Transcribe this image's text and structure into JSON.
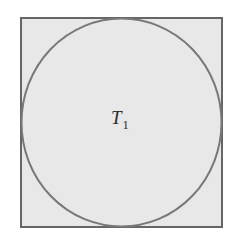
{
  "figure": {
    "background_color": "#ffffff",
    "width": 239,
    "height": 242,
    "square": {
      "name": "bounding-square",
      "x": 21,
      "y": 18,
      "width": 201,
      "height": 209,
      "fill_color": "#e8e8e8",
      "stroke_color": "#666666",
      "stroke_width": 2
    },
    "circle": {
      "name": "inscribed-circle",
      "center_x": 121.5,
      "center_y": 122.5,
      "radius_x": 100,
      "radius_y": 104,
      "fill": "none",
      "stroke_color": "#787878",
      "stroke_width": 2,
      "inscribed": true
    },
    "labels": [
      {
        "name": "region-label-T1",
        "base": "T",
        "subscript": "1",
        "x": 121,
        "y": 124,
        "color": "#2b2b2b",
        "style": "italic"
      }
    ]
  }
}
